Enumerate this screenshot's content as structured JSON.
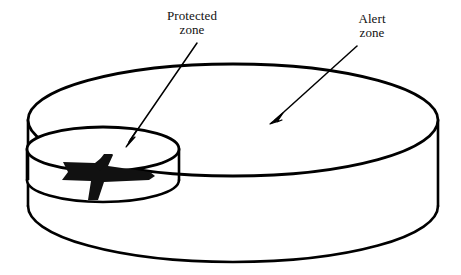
{
  "figure": {
    "background_color": "#ffffff",
    "stroke_color": "#000000",
    "aircraft_color": "#111111"
  },
  "labels": {
    "protected": {
      "name": "protected-zone-label",
      "line1": "Protected",
      "line2": "zone"
    },
    "alert": {
      "name": "alert-zone-label",
      "line1": "Alert",
      "line2": "zone"
    }
  },
  "shapes": {
    "alert_zone_cylinder": {
      "name": "alert-zone-cylinder",
      "top_ellipse": {
        "cx": 233,
        "cy": 120,
        "rx": 205,
        "ry": 56
      },
      "bottom_ellipse": {
        "cx": 233,
        "cy": 206,
        "rx": 205,
        "ry": 56
      },
      "height": 86
    },
    "protected_zone_cylinder": {
      "name": "protected-zone-cylinder",
      "top_ellipse": {
        "cx": 103,
        "cy": 149,
        "rx": 76,
        "ry": 22
      },
      "bottom_ellipse": {
        "cx": 103,
        "cy": 180,
        "rx": 76,
        "ry": 22
      },
      "height": 31
    },
    "aircraft": {
      "name": "aircraft-silhouette",
      "heading": "right",
      "nose": {
        "x": 155,
        "y": 178
      },
      "tail": {
        "x": 64,
        "y": 163
      }
    }
  },
  "arrows": {
    "protected": {
      "name": "protected-zone-arrow",
      "start": {
        "x": 197,
        "y": 43
      },
      "end": {
        "x": 126,
        "y": 146
      }
    },
    "alert": {
      "name": "alert-zone-arrow",
      "start": {
        "x": 357,
        "y": 46
      },
      "end": {
        "x": 271,
        "y": 123
      }
    }
  }
}
